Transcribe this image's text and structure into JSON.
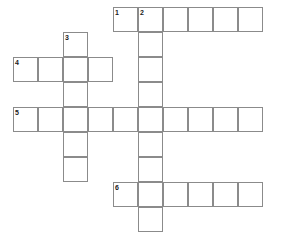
{
  "puzzle": {
    "kind": "crossword-grid",
    "title": "Crossword puzzle grid",
    "geometry": {
      "cell_size": 25,
      "origin_x": 13,
      "origin_y": 7,
      "columns": 10,
      "rows": 9,
      "canvas_width": 281,
      "canvas_height": 237
    },
    "colors": {
      "cell_fill": "#ffffff",
      "cell_border": "#8b8b8b",
      "number_color": "#1a1a1a",
      "background": "#ffffff"
    },
    "entries": [
      {
        "number": "1",
        "direction": "across",
        "row": 0,
        "col": 4,
        "length": 6,
        "value": ""
      },
      {
        "number": "2",
        "direction": "down",
        "row": 0,
        "col": 5,
        "length": 9,
        "value": ""
      },
      {
        "number": "3",
        "direction": "down",
        "row": 1,
        "col": 2,
        "length": 6,
        "value": ""
      },
      {
        "number": "4",
        "direction": "across",
        "row": 2,
        "col": 0,
        "length": 4,
        "value": ""
      },
      {
        "number": "5",
        "direction": "across",
        "row": 4,
        "col": 0,
        "length": 10,
        "value": ""
      },
      {
        "number": "6",
        "direction": "across",
        "row": 7,
        "col": 4,
        "length": 6,
        "value": ""
      }
    ],
    "cells": [
      {
        "row": 0,
        "col": 4,
        "number": "1",
        "letter": ""
      },
      {
        "row": 0,
        "col": 5,
        "number": "2",
        "letter": ""
      },
      {
        "row": 0,
        "col": 6,
        "number": "",
        "letter": ""
      },
      {
        "row": 0,
        "col": 7,
        "number": "",
        "letter": ""
      },
      {
        "row": 0,
        "col": 8,
        "number": "",
        "letter": ""
      },
      {
        "row": 0,
        "col": 9,
        "number": "",
        "letter": ""
      },
      {
        "row": 1,
        "col": 2,
        "number": "3",
        "letter": ""
      },
      {
        "row": 1,
        "col": 5,
        "number": "",
        "letter": ""
      },
      {
        "row": 2,
        "col": 0,
        "number": "4",
        "letter": ""
      },
      {
        "row": 2,
        "col": 1,
        "number": "",
        "letter": ""
      },
      {
        "row": 2,
        "col": 2,
        "number": "",
        "letter": ""
      },
      {
        "row": 2,
        "col": 3,
        "number": "",
        "letter": ""
      },
      {
        "row": 2,
        "col": 5,
        "number": "",
        "letter": ""
      },
      {
        "row": 3,
        "col": 2,
        "number": "",
        "letter": ""
      },
      {
        "row": 3,
        "col": 5,
        "number": "",
        "letter": ""
      },
      {
        "row": 4,
        "col": 0,
        "number": "5",
        "letter": ""
      },
      {
        "row": 4,
        "col": 1,
        "number": "",
        "letter": ""
      },
      {
        "row": 4,
        "col": 2,
        "number": "",
        "letter": ""
      },
      {
        "row": 4,
        "col": 3,
        "number": "",
        "letter": ""
      },
      {
        "row": 4,
        "col": 4,
        "number": "",
        "letter": ""
      },
      {
        "row": 4,
        "col": 5,
        "number": "",
        "letter": ""
      },
      {
        "row": 4,
        "col": 6,
        "number": "",
        "letter": ""
      },
      {
        "row": 4,
        "col": 7,
        "number": "",
        "letter": ""
      },
      {
        "row": 4,
        "col": 8,
        "number": "",
        "letter": ""
      },
      {
        "row": 4,
        "col": 9,
        "number": "",
        "letter": ""
      },
      {
        "row": 5,
        "col": 2,
        "number": "",
        "letter": ""
      },
      {
        "row": 5,
        "col": 5,
        "number": "",
        "letter": ""
      },
      {
        "row": 6,
        "col": 2,
        "number": "",
        "letter": ""
      },
      {
        "row": 6,
        "col": 5,
        "number": "",
        "letter": ""
      },
      {
        "row": 7,
        "col": 4,
        "number": "6",
        "letter": ""
      },
      {
        "row": 7,
        "col": 5,
        "number": "",
        "letter": ""
      },
      {
        "row": 7,
        "col": 6,
        "number": "",
        "letter": ""
      },
      {
        "row": 7,
        "col": 7,
        "number": "",
        "letter": ""
      },
      {
        "row": 7,
        "col": 8,
        "number": "",
        "letter": ""
      },
      {
        "row": 7,
        "col": 9,
        "number": "",
        "letter": ""
      },
      {
        "row": 8,
        "col": 5,
        "number": "",
        "letter": ""
      }
    ]
  }
}
